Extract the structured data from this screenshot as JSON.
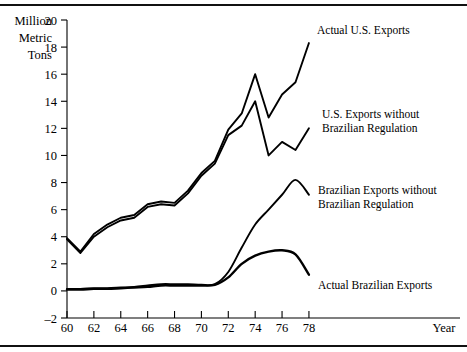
{
  "chart_data": {
    "type": "line",
    "title": "",
    "xlabel": "Year",
    "ylabel": "Million Metric Tons",
    "ylabel_lines": [
      "Million",
      "Metric",
      "Tons"
    ],
    "xlim": [
      60,
      78.6
    ],
    "ylim": [
      -2,
      20
    ],
    "y_ticks": [
      -2,
      0,
      2,
      4,
      6,
      8,
      10,
      12,
      14,
      16,
      18,
      20
    ],
    "y_tick_labels": [
      "–2",
      "0",
      "2",
      "4",
      "6",
      "8",
      "10",
      "12",
      "14",
      "16",
      "18",
      "20"
    ],
    "x_ticks": [
      60,
      62,
      64,
      66,
      68,
      70,
      72,
      74,
      76,
      78
    ],
    "x_tick_labels": [
      "60",
      "62",
      "64",
      "66",
      "68",
      "70",
      "72",
      "74",
      "76",
      "78"
    ],
    "grid": false,
    "legend": "annotations",
    "x": [
      60,
      61,
      62,
      63,
      64,
      65,
      66,
      67,
      68,
      69,
      70,
      71,
      72,
      73,
      74,
      75,
      76,
      77,
      78
    ],
    "series": [
      {
        "name": "Actual U.S. Exports",
        "values": [
          3.9,
          2.9,
          4.2,
          4.9,
          5.4,
          5.6,
          6.4,
          6.6,
          6.5,
          7.4,
          8.7,
          9.6,
          11.9,
          13.1,
          16.0,
          12.8,
          14.5,
          15.4,
          18.3
        ],
        "stroke_width": 1.9
      },
      {
        "name": "U.S. Exports without Brazilian Regulation",
        "values": [
          3.8,
          2.8,
          4.0,
          4.7,
          5.2,
          5.4,
          6.2,
          6.4,
          6.3,
          7.2,
          8.5,
          9.4,
          11.5,
          12.2,
          14.0,
          10.0,
          11.0,
          10.4,
          12.0
        ],
        "stroke_width": 1.9
      },
      {
        "name": "Brazilian Exports without Brazilian Regulation",
        "values": [
          0.15,
          0.15,
          0.2,
          0.2,
          0.25,
          0.3,
          0.4,
          0.5,
          0.5,
          0.5,
          0.45,
          0.5,
          1.4,
          3.2,
          4.9,
          6.0,
          7.1,
          8.2,
          7.1
        ],
        "stroke_width": 1.9
      },
      {
        "name": "Actual Brazilian Exports",
        "values": [
          0.1,
          0.1,
          0.15,
          0.15,
          0.2,
          0.25,
          0.3,
          0.4,
          0.4,
          0.4,
          0.4,
          0.45,
          1.0,
          2.0,
          2.6,
          2.9,
          3.0,
          2.7,
          1.2
        ],
        "stroke_width": 2.4
      }
    ],
    "annotations": [
      {
        "text_lines": [
          "Actual U.S. Exports"
        ],
        "x_px": 317,
        "y_px": 34
      },
      {
        "text_lines": [
          "U.S. Exports without",
          "Brazilian Regulation"
        ],
        "x_px": 322,
        "y_px": 118
      },
      {
        "text_lines": [
          "Brazilian Exports without",
          "Brazilian Regulation"
        ],
        "x_px": 318,
        "y_px": 194
      },
      {
        "text_lines": [
          "Actual Brazilian Exports"
        ],
        "x_px": 318,
        "y_px": 289
      }
    ]
  }
}
